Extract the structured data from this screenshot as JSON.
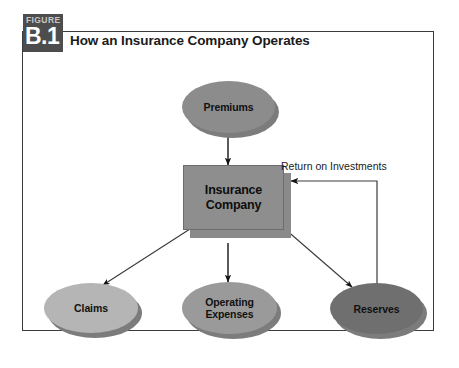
{
  "figure": {
    "tag_word": "FIGURE",
    "tag_number": "B.1",
    "title": "How an Insurance Company Operates"
  },
  "colors": {
    "tag_background": "#4d4d4d",
    "tag_number_text": "#ffffff",
    "tag_word_text": "#c6c6c6",
    "frame_border": "#3b3b3b",
    "canvas_background": "#ffffff",
    "box_fill": "#8e8e8e",
    "shadow": "#7c7c7c",
    "arrow": "#1a1a1a"
  },
  "nodes": {
    "premiums": {
      "label": "Premiums",
      "shape": "ellipse",
      "fill": "#8c8c8c"
    },
    "insurance_company": {
      "label_line1": "Insurance",
      "label_line2": "Company",
      "shape": "rectangle",
      "fill": "#8e8e8e"
    },
    "claims": {
      "label": "Claims",
      "shape": "ellipse",
      "fill": "#b5b5b5"
    },
    "operating_expenses": {
      "label_line1": "Operating",
      "label_line2": "Expenses",
      "shape": "ellipse",
      "fill": "#9a9a9a"
    },
    "reserves": {
      "label": "Reserves",
      "shape": "ellipse",
      "fill": "#6f6f6f"
    }
  },
  "edges": {
    "premiums_to_company": {
      "label": "",
      "from": "premiums",
      "to": "insurance_company"
    },
    "company_to_claims": {
      "label": "",
      "from": "insurance_company",
      "to": "claims"
    },
    "company_to_operating_expenses": {
      "label": "",
      "from": "insurance_company",
      "to": "operating_expenses"
    },
    "company_to_reserves": {
      "label": "",
      "from": "insurance_company",
      "to": "reserves"
    },
    "reserves_to_company": {
      "label": "Return on Investments",
      "from": "reserves",
      "to": "insurance_company"
    }
  }
}
